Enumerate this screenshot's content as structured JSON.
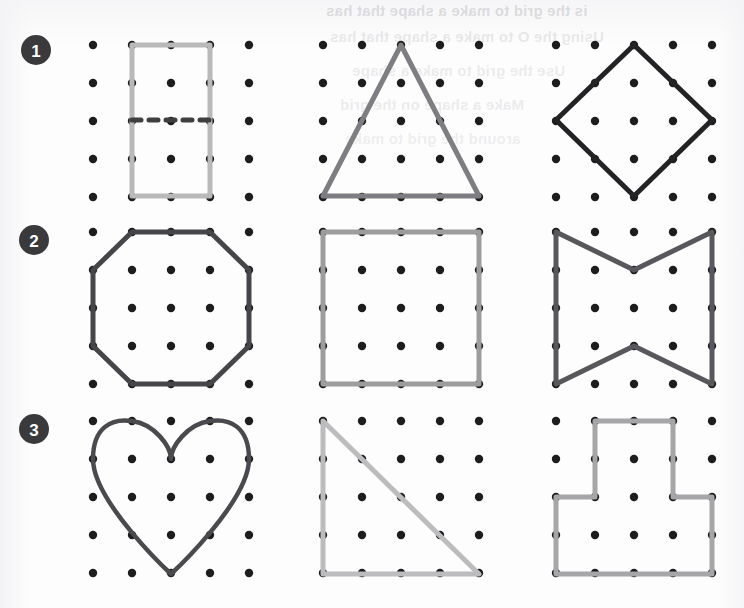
{
  "page": {
    "background_color": "#fdfdfd",
    "peg_color": "#1d1d1f",
    "width": 744,
    "height": 608
  },
  "bleed_through_text": {
    "note": "faint mirrored text showing through from the reverse side of the page",
    "lines": [
      "is the grid to make a shape that has",
      "Using the O to make a shape that has",
      "Use the grid to make a shape",
      "Make a shape on the grid",
      "around the grid to make"
    ]
  },
  "badges": [
    {
      "label": "1",
      "fill": "#3a3a3c",
      "text_color": "#ffffff"
    },
    {
      "label": "2",
      "fill": "#3a3a3c",
      "text_color": "#ffffff"
    },
    {
      "label": "3",
      "fill": "#3a3a3c",
      "text_color": "#ffffff"
    }
  ],
  "grid": {
    "columns": 5,
    "rows": 5,
    "spacing_x": 39,
    "spacing_y": 38,
    "peg_radius": 4.2,
    "origins": [
      {
        "x": 93,
        "y": 45
      },
      {
        "x": 323,
        "y": 45
      },
      {
        "x": 556,
        "y": 45
      },
      {
        "x": 93,
        "y": 232
      },
      {
        "x": 323,
        "y": 232
      },
      {
        "x": 556,
        "y": 232
      },
      {
        "x": 93,
        "y": 421
      },
      {
        "x": 323,
        "y": 421
      },
      {
        "x": 556,
        "y": 421
      }
    ]
  },
  "shapes": [
    {
      "id": "rectangle-with-dashed-midline",
      "name": "Rectangle",
      "row": 1,
      "column": 1,
      "color": "#b9b9ba",
      "stroke_width": 5,
      "type": "polygon",
      "points": "132,45 210,45 210,196 132,196",
      "closed": true,
      "extra": {
        "type": "dashed-line",
        "name": "midline",
        "points": "132,120 210,120",
        "color": "#3f3f42",
        "stroke_width": 5,
        "dash": "9 8"
      }
    },
    {
      "id": "equilateral-triangle",
      "name": "Triangle",
      "row": 1,
      "column": 2,
      "color": "#7e7e82",
      "stroke_width": 5,
      "type": "polygon",
      "points": "401,45 479,196 323,196",
      "closed": true
    },
    {
      "id": "diamond-rhombus",
      "name": "Diamond",
      "row": 1,
      "column": 3,
      "color": "#232326",
      "stroke_width": 5,
      "type": "polygon",
      "points": "634,45 712,120 634,196 556,120",
      "closed": true
    },
    {
      "id": "octagon",
      "name": "Octagon",
      "row": 2,
      "column": 1,
      "color": "#46464a",
      "stroke_width": 5,
      "type": "polygon",
      "points": "132,232 210,232 249,270 249,346 210,384 132,384 93,346 93,270",
      "closed": true
    },
    {
      "id": "square",
      "name": "Square",
      "row": 2,
      "column": 2,
      "color": "#9d9da0",
      "stroke_width": 5,
      "type": "polygon",
      "points": "323,232 479,232 479,384 323,384",
      "closed": true
    },
    {
      "id": "concave-hexagon-bowtie",
      "name": "Concave hexagon",
      "row": 2,
      "column": 3,
      "color": "#58585c",
      "stroke_width": 5,
      "type": "polygon",
      "points": "556,232 634,270 712,232 712,384 634,346 556,384",
      "closed": true
    },
    {
      "id": "heart",
      "name": "Heart",
      "row": 3,
      "column": 1,
      "color": "#4a4a4e",
      "stroke_width": 4.5,
      "type": "path",
      "path": "M171,574 C171,574 93,502 93,459 C93,427 112,418 132,421 C155,424 171,447 171,459 C171,447 187,424 210,421 C230,418 249,427 249,459 C249,502 171,574 171,574 Z"
    },
    {
      "id": "right-triangle",
      "name": "Right triangle",
      "row": 3,
      "column": 2,
      "color": "#bcbcbe",
      "stroke_width": 5,
      "type": "polygon",
      "points": "323,421 479,574 323,574",
      "closed": true
    },
    {
      "id": "t-shape-polygon",
      "name": "T-shaped polygon",
      "row": 3,
      "column": 3,
      "color": "#a6a6a9",
      "stroke_width": 5,
      "type": "polygon",
      "points": "595,421 673,421 673,497 712,497 712,574 556,574 556,497 595,497",
      "closed": true
    }
  ]
}
